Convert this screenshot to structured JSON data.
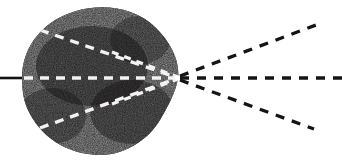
{
  "figure": {
    "width": 342,
    "height": 162,
    "background_color": "#ffffff"
  },
  "colors": {
    "particle_fill": "#1d1c1b",
    "particle_fill_dark": "#0e0e0d",
    "incoming_ray": "#111111",
    "internal_ray": "#f2f2f0",
    "outgoing_ray": "#141414",
    "background": "#ffffff"
  },
  "chart_data": {
    "type": "scatter",
    "xlabel": "",
    "ylabel": "",
    "xlim": [
      0,
      342
    ],
    "ylim": [
      0,
      162
    ],
    "grid": false,
    "legend": "none",
    "focus_point": {
      "x": 178,
      "y": 78
    },
    "particle": {
      "label": "dark textured particle",
      "centroid": {
        "x": 100,
        "y": 81
      },
      "bounds": {
        "x_min": 20,
        "x_max": 180,
        "y_min": 8,
        "y_max": 156
      },
      "outline": "M 22,78 C 22,46 44,20 76,11 C 104,3 136,8 156,28 C 172,44 180,62 178,78 C 176,92 168,106 160,120 C 148,140 124,156 98,155 C 66,154 40,136 28,110 C 23,99 22,88 22,78 Z"
    },
    "series": [
      {
        "name": "incoming-solid-ray",
        "style": "solid",
        "color": "#111111",
        "x": [
          0,
          22
        ],
        "y": [
          78,
          78
        ]
      },
      {
        "name": "internal-ray-upper",
        "style": "dashed",
        "color": "#f2f2f0",
        "x": [
          40,
          178
        ],
        "y": [
          30,
          78
        ]
      },
      {
        "name": "internal-ray-axis",
        "style": "dashed",
        "color": "#f2f2f0",
        "x": [
          24,
          178
        ],
        "y": [
          78,
          78
        ]
      },
      {
        "name": "internal-ray-lower",
        "style": "dashed",
        "color": "#f2f2f0",
        "x": [
          40,
          178
        ],
        "y": [
          128,
          78
        ]
      },
      {
        "name": "outgoing-ray-upper",
        "style": "dashed",
        "color": "#141414",
        "x": [
          180,
          316
        ],
        "y": [
          76,
          25
        ]
      },
      {
        "name": "outgoing-ray-axis",
        "style": "dashed",
        "color": "#141414",
        "x": [
          180,
          342
        ],
        "y": [
          78,
          78
        ]
      },
      {
        "name": "outgoing-ray-lower",
        "style": "dashed",
        "color": "#141414",
        "x": [
          180,
          314
        ],
        "y": [
          80,
          129
        ]
      }
    ]
  }
}
